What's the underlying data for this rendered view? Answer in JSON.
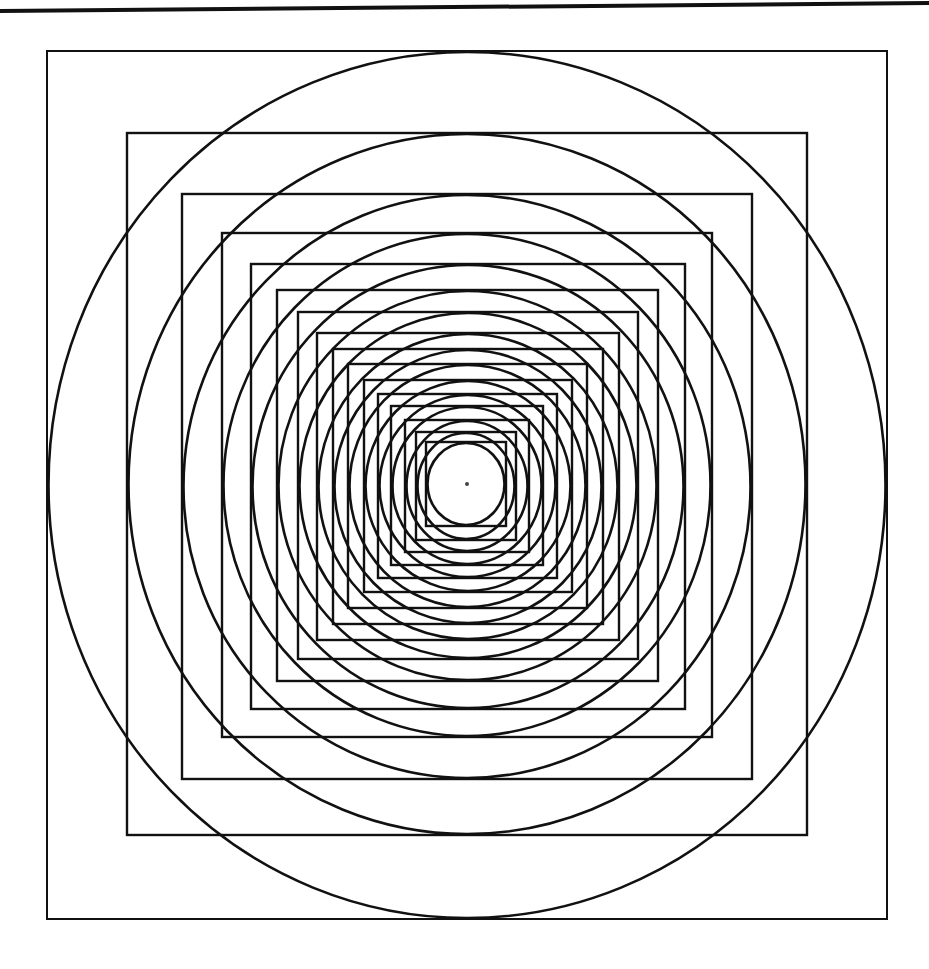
{
  "figure": {
    "width": 929,
    "height": 969,
    "background": "#ffffff",
    "stroke_color": "#111111",
    "top_rule": {
      "x1": 0,
      "y1": 11,
      "x2": 929,
      "y2": 3,
      "width": 4
    },
    "center_dot": {
      "cx": 467,
      "cy": 484,
      "r": 2
    },
    "squares": [
      {
        "l": 47,
        "t": 51,
        "r": 887,
        "b": 919
      },
      {
        "l": 127,
        "t": 133,
        "r": 807,
        "b": 835
      },
      {
        "l": 182,
        "t": 194,
        "r": 752,
        "b": 779
      },
      {
        "l": 222,
        "t": 233,
        "r": 712,
        "b": 737
      },
      {
        "l": 251,
        "t": 264,
        "r": 685,
        "b": 709
      },
      {
        "l": 277,
        "t": 290,
        "r": 658,
        "b": 681
      },
      {
        "l": 298,
        "t": 312,
        "r": 638,
        "b": 659
      },
      {
        "l": 317,
        "t": 333,
        "r": 619,
        "b": 640
      },
      {
        "l": 333,
        "t": 349,
        "r": 603,
        "b": 624
      },
      {
        "l": 348,
        "t": 364,
        "r": 587,
        "b": 608
      },
      {
        "l": 364,
        "t": 380,
        "r": 572,
        "b": 592
      },
      {
        "l": 378,
        "t": 394,
        "r": 557,
        "b": 578
      },
      {
        "l": 391,
        "t": 406,
        "r": 543,
        "b": 565
      },
      {
        "l": 405,
        "t": 420,
        "r": 529,
        "b": 552
      },
      {
        "l": 416,
        "t": 432,
        "r": 516,
        "b": 540
      },
      {
        "l": 426,
        "t": 442,
        "r": 506,
        "b": 526
      }
    ],
    "circles_inscribed": true
  }
}
